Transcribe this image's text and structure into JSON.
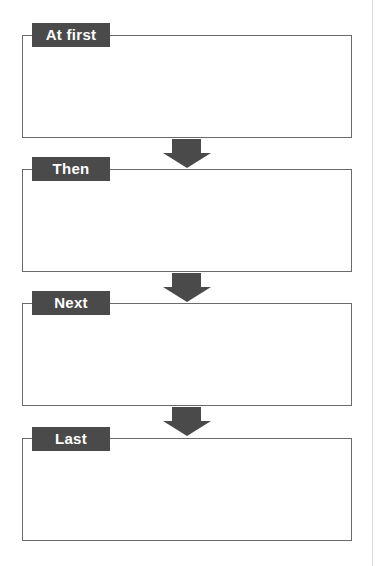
{
  "diagram": {
    "type": "sequence-flow",
    "colors": {
      "label_bg": "#4a4a4a",
      "label_text": "#ffffff",
      "box_border": "#6a6a6a",
      "arrow": "#4a4a4a"
    },
    "steps": [
      {
        "label": "At first",
        "content": ""
      },
      {
        "label": "Then",
        "content": ""
      },
      {
        "label": "Next",
        "content": ""
      },
      {
        "label": "Last",
        "content": ""
      }
    ],
    "connectors": [
      {
        "from": "At first",
        "to": "Then",
        "icon": "down-arrow-icon"
      },
      {
        "from": "Then",
        "to": "Next",
        "icon": "down-arrow-icon"
      },
      {
        "from": "Next",
        "to": "Last",
        "icon": "down-arrow-icon"
      }
    ]
  }
}
